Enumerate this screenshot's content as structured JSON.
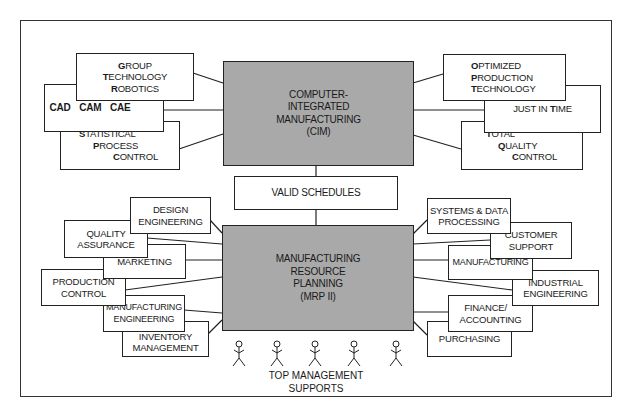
{
  "diagram": {
    "title_center_top": {
      "lines": [
        "COMPUTER-",
        "INTEGRATED",
        "MANUFACTURING",
        "(CIM)"
      ]
    },
    "connector_box": {
      "label": "VALID SCHEDULES"
    },
    "title_center_bottom": {
      "lines": [
        "MANUFACTURING",
        "RESOURCE",
        "PLANNING",
        "(MRP II)"
      ]
    },
    "cim_left": [
      {
        "id": "group-technology-robotics",
        "lines": [
          "GROUP",
          "TECHNOLOGY",
          "ROBOTICS"
        ]
      },
      {
        "id": "cad-cam-cae",
        "lines": [
          "CAD   CAM   CAE"
        ]
      },
      {
        "id": "statistical-process-control",
        "lines": [
          "STATISTICAL",
          "PROCESS",
          "CONTROL"
        ]
      }
    ],
    "cim_right": [
      {
        "id": "optimized-production-technology",
        "lines": [
          "OPTIMIZED",
          "PRODUCTION",
          "TECHNOLOGY"
        ]
      },
      {
        "id": "just-in-time",
        "lines": [
          "JUST IN TIME"
        ]
      },
      {
        "id": "total-quality-control",
        "lines": [
          "TOTAL",
          "QUALITY",
          "CONTROL"
        ]
      }
    ],
    "mrp_left": [
      {
        "id": "design-engineering",
        "lines": [
          "DESIGN",
          "ENGINEERING"
        ]
      },
      {
        "id": "quality-assurance",
        "lines": [
          "QUALITY",
          "ASSURANCE"
        ]
      },
      {
        "id": "marketing",
        "lines": [
          "MARKETING"
        ]
      },
      {
        "id": "production-control",
        "lines": [
          "PRODUCTION",
          "CONTROL"
        ]
      },
      {
        "id": "manufacturing-engineering",
        "lines": [
          "MANUFACTURING",
          "ENGINEERING"
        ]
      },
      {
        "id": "inventory-management",
        "lines": [
          "INVENTORY",
          "MANAGEMENT"
        ]
      }
    ],
    "mrp_right": [
      {
        "id": "systems-data-processing",
        "lines": [
          "SYSTEMS & DATA",
          "PROCESSING"
        ]
      },
      {
        "id": "customer-support",
        "lines": [
          "CUSTOMER",
          "SUPPORT"
        ]
      },
      {
        "id": "manufacturing",
        "lines": [
          "MANUFACTURING"
        ]
      },
      {
        "id": "industrial-engineering",
        "lines": [
          "INDUSTRIAL",
          "ENGINEERING"
        ]
      },
      {
        "id": "finance-accounting",
        "lines": [
          "FINANCE/",
          "ACCOUNTING"
        ]
      },
      {
        "id": "purchasing",
        "lines": [
          "PURCHASING"
        ]
      }
    ],
    "support": {
      "figure_count": 5,
      "lines": [
        "TOP MANAGEMENT",
        "SUPPORTS"
      ]
    },
    "colors": {
      "box_fill": "#ffffff",
      "center_fill": "#a9a9a9",
      "stroke": "#222222"
    }
  }
}
